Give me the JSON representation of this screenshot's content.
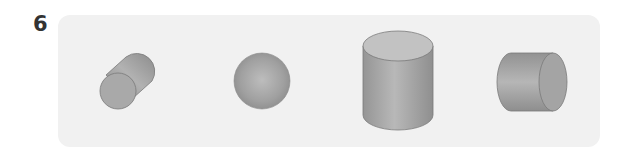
{
  "question": {
    "number": "6"
  },
  "panel": {
    "background": "#f1f1f1",
    "shapes": [
      {
        "id": "tilted-cylinder",
        "label": "cylinder (tilted)"
      },
      {
        "id": "sphere",
        "label": "sphere"
      },
      {
        "id": "upright-cylinder",
        "label": "cylinder (upright)"
      },
      {
        "id": "horizontal-cylinder",
        "label": "cylinder (horizontal)"
      }
    ]
  },
  "colors": {
    "shape_dark": "#8c8c8c",
    "shape_mid": "#a8a8a8",
    "shape_light": "#c4c4c4",
    "outline": "#7a7a7a",
    "number": "#333333"
  }
}
